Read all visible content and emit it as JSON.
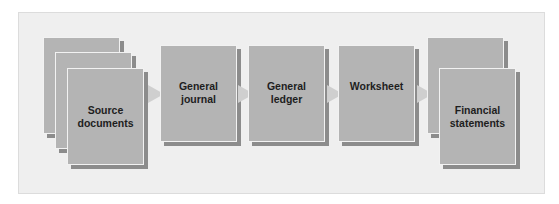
{
  "diagram": {
    "type": "flow",
    "direction": "left-to-right",
    "nodes": [
      {
        "id": "source",
        "label_line1": "Source",
        "label_line2": "documents",
        "stacked_pages": 3
      },
      {
        "id": "journal",
        "label_line1": "General",
        "label_line2": "journal",
        "stacked_pages": 1
      },
      {
        "id": "ledger",
        "label_line1": "General",
        "label_line2": "ledger",
        "stacked_pages": 1
      },
      {
        "id": "worksheet",
        "label_line1": "Worksheet",
        "label_line2": "",
        "stacked_pages": 1
      },
      {
        "id": "statements",
        "label_line1": "Financial",
        "label_line2": "statements",
        "stacked_pages": 2
      }
    ],
    "edges": [
      {
        "from": "source",
        "to": "journal"
      },
      {
        "from": "journal",
        "to": "ledger"
      },
      {
        "from": "ledger",
        "to": "worksheet"
      },
      {
        "from": "worksheet",
        "to": "statements"
      }
    ],
    "colors": {
      "panel": "#efefef",
      "box": "#b4b4b4",
      "shadow": "#8c8c8c",
      "arrow": "#cfcfcf",
      "text": "#1e1e1e"
    }
  }
}
